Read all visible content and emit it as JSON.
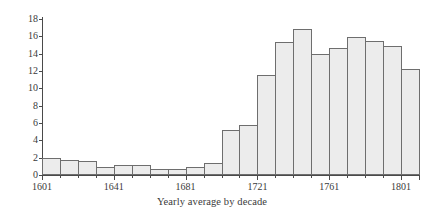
{
  "chart_data": {
    "type": "bar",
    "title": "",
    "xlabel": "Yearly average by decade",
    "ylabel": "Tons per year",
    "ylim": [
      0,
      18
    ],
    "yticks": [
      0,
      2,
      4,
      6,
      8,
      10,
      12,
      14,
      16,
      18
    ],
    "xlim": [
      1601,
      1811
    ],
    "xticks": [
      1601,
      1641,
      1681,
      1721,
      1761,
      1801
    ],
    "xticklabels": [
      "1601",
      "1641",
      "1681",
      "1721",
      "1761",
      "1801"
    ],
    "grid": false,
    "bar_style": {
      "fill": "#ececec",
      "edge": "#6e6e6e"
    },
    "categories": [
      "1601",
      "1611",
      "1621",
      "1631",
      "1641",
      "1651",
      "1661",
      "1671",
      "1681",
      "1691",
      "1701",
      "1711",
      "1721",
      "1731",
      "1741",
      "1751",
      "1761",
      "1771",
      "1781",
      "1791",
      "1801"
    ],
    "values": [
      2.0,
      1.7,
      1.65,
      0.9,
      1.1,
      1.1,
      0.75,
      0.7,
      0.95,
      1.35,
      5.15,
      5.75,
      11.5,
      15.35,
      16.85,
      13.95,
      14.7,
      15.95,
      15.5,
      14.9,
      12.2
    ]
  }
}
